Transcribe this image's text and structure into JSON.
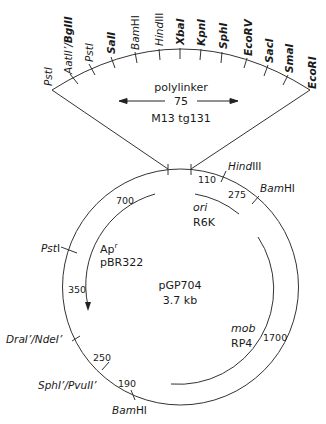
{
  "plasmid": {
    "name": "pGP704",
    "size": "3.7 kb"
  },
  "polylinker": {
    "title": "polylinker",
    "length": "75",
    "source": "M13 tg131",
    "sites": [
      {
        "prefix": "",
        "italic": "PstI",
        "suffix": "",
        "bold": false
      },
      {
        "italic": "AatII’/",
        "bold_part": "BglII",
        "bold": true
      },
      {
        "italic": "PstI",
        "bold": false
      },
      {
        "italic": "SalI",
        "bold": true
      },
      {
        "italic": "Bam",
        "suffix": "HI",
        "bold": false
      },
      {
        "italic": "Hind",
        "suffix": "III",
        "bold": false
      },
      {
        "italic": "XbaI",
        "bold": true
      },
      {
        "italic": "KpnI",
        "bold": true
      },
      {
        "italic": "SphI",
        "bold": true
      },
      {
        "italic": "EcoRV",
        "bold": true
      },
      {
        "italic": "SacI",
        "bold": true
      },
      {
        "italic": "SmaI",
        "bold": true
      },
      {
        "italic": "EcoRI",
        "bold": true
      }
    ]
  },
  "map_sites": {
    "hindiii": {
      "italic": "Hind",
      "rest": "III"
    },
    "bamhi_top": {
      "italic": "Bam",
      "rest": "HI"
    },
    "psti": {
      "italic": "Pst",
      "rest": "I"
    },
    "drai_ndei": {
      "text": "DraI’/NdeI’"
    },
    "sphi_pvuii": {
      "text": "SphI’/PvuII’"
    },
    "bamhi_bottom": {
      "italic": "Bam",
      "rest": "HI"
    }
  },
  "distances": {
    "d110": "110",
    "d275": "275",
    "d700": "700",
    "d350": "350",
    "d250": "250",
    "d190": "190",
    "d1700": "1700"
  },
  "features": {
    "ori": {
      "italic": "ori",
      "name": "R6K"
    },
    "apr": {
      "name": "Ap",
      "sup": "r",
      "source": "pBR322"
    },
    "mob": {
      "italic": "mob",
      "name": "RP4"
    }
  },
  "colors": {
    "line": "#333333",
    "text": "#1a1a1a",
    "background": "#ffffff"
  }
}
